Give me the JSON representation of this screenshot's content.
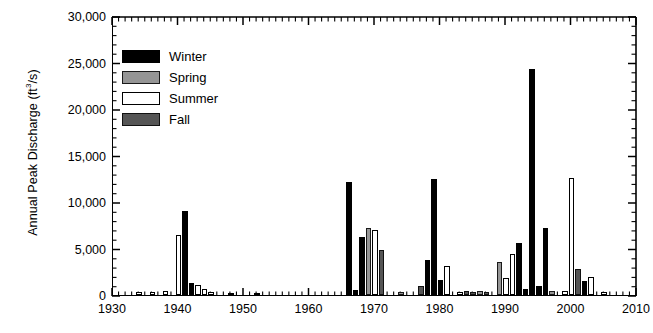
{
  "chart_data": {
    "type": "bar",
    "title": "",
    "xlabel": "",
    "ylabel": "Annual Peak Discharge (ft³/s)",
    "ylabel_main": "Annual Peak Discharge (ft",
    "ylabel_sup": "3",
    "ylabel_tail": "/s)",
    "xlim": [
      1930,
      2010
    ],
    "ylim": [
      0,
      30000
    ],
    "grid": false,
    "legend_position": "upper-left-inside",
    "x_tick_labels": [
      "1930",
      "1940",
      "1950",
      "1960",
      "1970",
      "1980",
      "1990",
      "2000",
      "2010"
    ],
    "x_tick_values": [
      1930,
      1940,
      1950,
      1960,
      1970,
      1980,
      1990,
      2000,
      2010
    ],
    "x_minor_tick_step": 1,
    "y_tick_labels": [
      "0",
      "5,000",
      "10,000",
      "15,000",
      "20,000",
      "25,000",
      "30,000"
    ],
    "y_tick_values": [
      0,
      5000,
      10000,
      15000,
      20000,
      25000,
      30000
    ],
    "y_minor_tick_step": 1000,
    "legend": [
      {
        "name": "Winter",
        "key": "winter",
        "color": "#000000"
      },
      {
        "name": "Spring",
        "key": "spring",
        "color": "#959595"
      },
      {
        "name": "Summer",
        "key": "summer",
        "color": "#ffffff"
      },
      {
        "name": "Fall",
        "key": "fall",
        "color": "#555555"
      }
    ],
    "bar_width_years": 0.85,
    "bars": [
      {
        "year": 1934,
        "season": "summer",
        "value": 300
      },
      {
        "year": 1936,
        "season": "summer",
        "value": 350
      },
      {
        "year": 1938,
        "season": "summer",
        "value": 400
      },
      {
        "year": 1940,
        "season": "summer",
        "value": 6400
      },
      {
        "year": 1941,
        "season": "winter",
        "value": 9000
      },
      {
        "year": 1942,
        "season": "winter",
        "value": 1300
      },
      {
        "year": 1943,
        "season": "summer",
        "value": 1100
      },
      {
        "year": 1944,
        "season": "summer",
        "value": 600
      },
      {
        "year": 1945,
        "season": "summer",
        "value": 300
      },
      {
        "year": 1948,
        "season": "summer",
        "value": 250
      },
      {
        "year": 1952,
        "season": "summer",
        "value": 250
      },
      {
        "year": 1966,
        "season": "winter",
        "value": 12100
      },
      {
        "year": 1967,
        "season": "winter",
        "value": 500
      },
      {
        "year": 1968,
        "season": "winter",
        "value": 6200
      },
      {
        "year": 1969,
        "season": "spring",
        "value": 7200
      },
      {
        "year": 1970,
        "season": "summer",
        "value": 7000
      },
      {
        "year": 1971,
        "season": "fall",
        "value": 4800
      },
      {
        "year": 1974,
        "season": "spring",
        "value": 300
      },
      {
        "year": 1977,
        "season": "fall",
        "value": 1000
      },
      {
        "year": 1978,
        "season": "winter",
        "value": 3800
      },
      {
        "year": 1979,
        "season": "winter",
        "value": 12500
      },
      {
        "year": 1980,
        "season": "winter",
        "value": 1600
      },
      {
        "year": 1981,
        "season": "summer",
        "value": 3100
      },
      {
        "year": 1983,
        "season": "summer",
        "value": 300
      },
      {
        "year": 1984,
        "season": "fall",
        "value": 400
      },
      {
        "year": 1985,
        "season": "fall",
        "value": 350
      },
      {
        "year": 1986,
        "season": "spring",
        "value": 400
      },
      {
        "year": 1987,
        "season": "fall",
        "value": 350
      },
      {
        "year": 1989,
        "season": "spring",
        "value": 3500
      },
      {
        "year": 1990,
        "season": "summer",
        "value": 1800
      },
      {
        "year": 1991,
        "season": "summer",
        "value": 4400
      },
      {
        "year": 1992,
        "season": "winter",
        "value": 5600
      },
      {
        "year": 1993,
        "season": "winter",
        "value": 600
      },
      {
        "year": 1994,
        "season": "winter",
        "value": 24300
      },
      {
        "year": 1995,
        "season": "winter",
        "value": 1000
      },
      {
        "year": 1996,
        "season": "winter",
        "value": 7200
      },
      {
        "year": 1997,
        "season": "spring",
        "value": 400
      },
      {
        "year": 1999,
        "season": "summer",
        "value": 400
      },
      {
        "year": 2000,
        "season": "summer",
        "value": 12600
      },
      {
        "year": 2001,
        "season": "fall",
        "value": 2800
      },
      {
        "year": 2002,
        "season": "winter",
        "value": 1500
      },
      {
        "year": 2003,
        "season": "summer",
        "value": 1900
      },
      {
        "year": 2005,
        "season": "summer",
        "value": 300
      }
    ]
  }
}
